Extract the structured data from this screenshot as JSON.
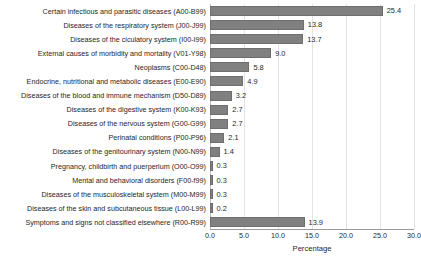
{
  "chart_data": {
    "type": "bar",
    "orientation": "horizontal",
    "title": "",
    "xlabel": "Percentage",
    "ylabel": "",
    "xlim": [
      0.0,
      30.0
    ],
    "xticks": [
      "0.0",
      "5.0",
      "10.0",
      "15.0",
      "20.0",
      "25.0",
      "30.0"
    ],
    "xtick_values": [
      0.0,
      5.0,
      10.0,
      15.0,
      20.0,
      25.0,
      30.0
    ],
    "grid": true,
    "legend": false,
    "bar_color": "#808080",
    "bar_edge_color": "#6e6e6e",
    "categories": [
      "Certain infectious and parasitic diseases (A00-B99)",
      "Diseases of the respiratory system (J00-J99)",
      "Diseases of the ciculatory system (I00-I99)",
      "External causes of morbidity and mortality (V01-Y98)",
      "Neoplasms (C00-D48)",
      "Endocrine, nutritional and metabolic diseases (E00-E90)",
      "Diseases of the blood and immune mechanism (D50-D89)",
      "Diseases of the digestive system (K00-K93)",
      "Diseases of the nervous system (G00-G99)",
      "Perinatal conditions (P00-P96)",
      "Diseases of the genitourinary system (N00-N99)",
      "Pregnancy, childbirth and puerperium (O00-O99)",
      "Mental and behavioral disorders (F00-f99)",
      "Diseases of the musculoskeletal system (M00-M99)",
      "Diseases of the skin and subcutaneous tissue (L00-L99)",
      "Symptoms and signs not classified elsewhere (R00-R99)"
    ],
    "values": [
      25.4,
      13.8,
      13.7,
      9.0,
      5.8,
      4.9,
      3.2,
      2.7,
      2.7,
      2.1,
      1.4,
      0.3,
      0.3,
      0.3,
      0.2,
      13.9
    ],
    "value_labels": [
      "25.4",
      "13.8",
      "13.7",
      "9.0",
      "5.8",
      "4.9",
      "3.2",
      "2.7",
      "2.7",
      "2.1",
      "1.4",
      "0.3",
      "0.3",
      "0.3",
      "0.2",
      "13.9"
    ]
  }
}
